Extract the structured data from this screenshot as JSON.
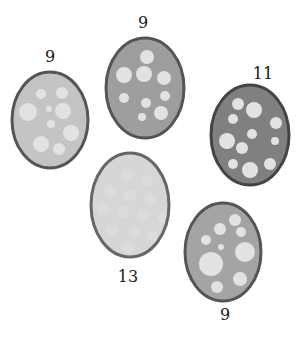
{
  "diagram": {
    "eggs": [
      {
        "id": "egg-left",
        "label": "9",
        "cx": 50,
        "cy": 120,
        "rx": 38,
        "ry": 48,
        "fill": "#c4c4c4",
        "stroke": "#555555",
        "label_x": 50,
        "label_y": 62,
        "spots": [
          {
            "cx": 41,
            "cy": 94,
            "r": 5
          },
          {
            "cx": 62,
            "cy": 93,
            "r": 6
          },
          {
            "cx": 28,
            "cy": 112,
            "r": 9
          },
          {
            "cx": 49,
            "cy": 109,
            "r": 3
          },
          {
            "cx": 63,
            "cy": 111,
            "r": 8
          },
          {
            "cx": 51,
            "cy": 124,
            "r": 4
          },
          {
            "cx": 71,
            "cy": 133,
            "r": 8
          },
          {
            "cx": 41,
            "cy": 144,
            "r": 8
          },
          {
            "cx": 59,
            "cy": 149,
            "r": 6
          }
        ]
      },
      {
        "id": "egg-top-middle",
        "label": "9",
        "cx": 145,
        "cy": 88,
        "rx": 39,
        "ry": 50,
        "fill": "#9e9e9e",
        "stroke": "#555555",
        "label_x": 143,
        "label_y": 28,
        "spots": [
          {
            "cx": 147,
            "cy": 57,
            "r": 7
          },
          {
            "cx": 124,
            "cy": 75,
            "r": 8
          },
          {
            "cx": 144,
            "cy": 74,
            "r": 8
          },
          {
            "cx": 164,
            "cy": 78,
            "r": 7
          },
          {
            "cx": 124,
            "cy": 98,
            "r": 5
          },
          {
            "cx": 165,
            "cy": 96,
            "r": 5
          },
          {
            "cx": 146,
            "cy": 103,
            "r": 5
          },
          {
            "cx": 161,
            "cy": 113,
            "r": 7
          },
          {
            "cx": 142,
            "cy": 117,
            "r": 4
          }
        ]
      },
      {
        "id": "egg-right",
        "label": "11",
        "cx": 250,
        "cy": 135,
        "rx": 39,
        "ry": 50,
        "fill": "#808080",
        "stroke": "#444444",
        "label_x": 263,
        "label_y": 79,
        "spots": [
          {
            "cx": 238,
            "cy": 104,
            "r": 6
          },
          {
            "cx": 254,
            "cy": 110,
            "r": 8
          },
          {
            "cx": 233,
            "cy": 119,
            "r": 5
          },
          {
            "cx": 276,
            "cy": 123,
            "r": 6
          },
          {
            "cx": 252,
            "cy": 134,
            "r": 5
          },
          {
            "cx": 275,
            "cy": 141,
            "r": 4
          },
          {
            "cx": 227,
            "cy": 141,
            "r": 8
          },
          {
            "cx": 242,
            "cy": 148,
            "r": 6
          },
          {
            "cx": 233,
            "cy": 164,
            "r": 5
          },
          {
            "cx": 250,
            "cy": 170,
            "r": 8
          },
          {
            "cx": 270,
            "cy": 164,
            "r": 6
          }
        ]
      },
      {
        "id": "egg-center",
        "label": "13",
        "cx": 130,
        "cy": 205,
        "rx": 39,
        "ry": 52,
        "fill": "#d6d6d6",
        "stroke": "#666666",
        "label_x": 128,
        "label_y": 282,
        "spots": [
          {
            "cx": 127,
            "cy": 175,
            "r": 6
          },
          {
            "cx": 147,
            "cy": 181,
            "r": 6
          },
          {
            "cx": 110,
            "cy": 191,
            "r": 6
          },
          {
            "cx": 130,
            "cy": 195,
            "r": 6
          },
          {
            "cx": 150,
            "cy": 199,
            "r": 6
          },
          {
            "cx": 103,
            "cy": 209,
            "r": 6
          },
          {
            "cx": 123,
            "cy": 212,
            "r": 6
          },
          {
            "cx": 143,
            "cy": 215,
            "r": 6
          },
          {
            "cx": 162,
            "cy": 218,
            "r": 5
          },
          {
            "cx": 112,
            "cy": 230,
            "r": 6
          },
          {
            "cx": 135,
            "cy": 232,
            "r": 6
          },
          {
            "cx": 153,
            "cy": 236,
            "r": 5
          },
          {
            "cx": 128,
            "cy": 248,
            "r": 6
          }
        ]
      },
      {
        "id": "egg-bottom-right",
        "label": "9",
        "cx": 223,
        "cy": 252,
        "rx": 38,
        "ry": 49,
        "fill": "#a4a4a4",
        "stroke": "#555555",
        "label_x": 225,
        "label_y": 320,
        "spots": [
          {
            "cx": 235,
            "cy": 220,
            "r": 6
          },
          {
            "cx": 220,
            "cy": 229,
            "r": 6
          },
          {
            "cx": 241,
            "cy": 232,
            "r": 5
          },
          {
            "cx": 206,
            "cy": 240,
            "r": 5
          },
          {
            "cx": 221,
            "cy": 247,
            "r": 3
          },
          {
            "cx": 245,
            "cy": 252,
            "r": 10
          },
          {
            "cx": 211,
            "cy": 264,
            "r": 12
          },
          {
            "cx": 240,
            "cy": 279,
            "r": 7
          },
          {
            "cx": 217,
            "cy": 287,
            "r": 6
          }
        ]
      }
    ]
  }
}
